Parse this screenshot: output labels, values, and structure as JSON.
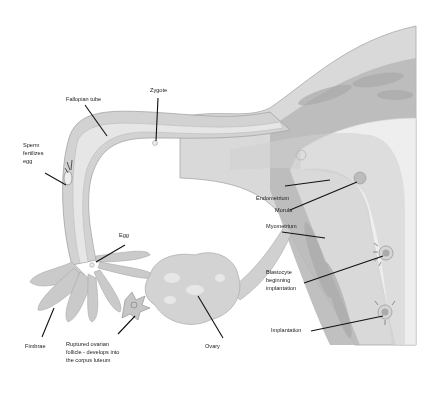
{
  "diagram": {
    "labels": {
      "fallopian_tube": "Fallopian tube",
      "zygote": "Zygote",
      "sperm_fertilizes_egg": "Sperm\nfertilizes\negg",
      "egg": "Egg",
      "endometrium": "Endometrium",
      "morula": "Morula",
      "myometrium": "Myometrium",
      "blastocyte": "Blastocyte\nbeginning\nimplantation",
      "implantation": "Implantation",
      "fimbrae": "Fimbrae",
      "ruptured_follicle": "Ruptured ovarian\nfollicle - develops into\nthe corpus luteum",
      "ovary": "Ovary"
    },
    "colors": {
      "outer_wall": "#d6d6d6",
      "tube_mid": "#c4c4c4",
      "tube_lumen": "#e4e4e4",
      "myometrium": "#b5b5b5",
      "endometrium": "#ececec",
      "ovary": "#cfcfcf",
      "leader_line": "#111111"
    }
  }
}
